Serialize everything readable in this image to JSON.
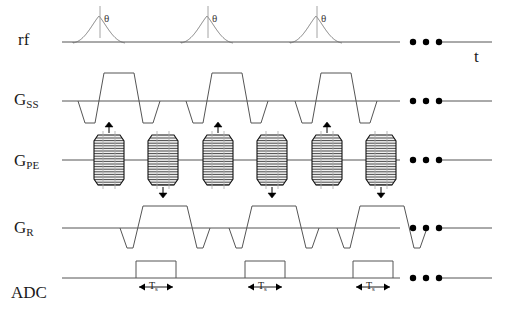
{
  "figure": {
    "type": "mri-pulse-sequence-diagram",
    "title": "",
    "background_color": "#ffffff",
    "line_color": "#555555",
    "text_color": "#1a1a1a",
    "blip_fill_color": "#f2f2f2",
    "blip_stroke_color": "#111111",
    "arrow_color": "#000000",
    "width": 514,
    "height": 315
  },
  "axis": {
    "time_label": "t",
    "time_label_x": 474,
    "time_label_y": 47
  },
  "rows": [
    {
      "name": "rf",
      "label": "rf",
      "label_sub": "",
      "label_x": 18,
      "label_y": 31,
      "baseline_y": 42,
      "line_start_x": 62,
      "line_end_x": 492,
      "events": [
        {
          "kind": "sinc-pulse",
          "x": 99,
          "annotation": "θ",
          "annotation_x": 104,
          "annotation_y": 12
        },
        {
          "kind": "sinc-pulse",
          "x": 207,
          "annotation": "θ",
          "annotation_x": 212,
          "annotation_y": 12
        },
        {
          "kind": "sinc-pulse",
          "x": 316,
          "annotation": "θ",
          "annotation_x": 321,
          "annotation_y": 12
        }
      ],
      "ellipsis": {
        "x": 413,
        "y": 42,
        "count": 3
      },
      "gap": {
        "from": 400,
        "to": 440
      }
    },
    {
      "name": "G_SS",
      "label": "G",
      "label_sub": "SS",
      "label_x": 14,
      "label_y": 91,
      "baseline_y": 101,
      "line_start_x": 62,
      "line_end_x": 492,
      "events": [
        {
          "kind": "ss-lobe",
          "x": 78
        },
        {
          "kind": "ss-lobe",
          "x": 186
        },
        {
          "kind": "ss-lobe",
          "x": 295
        }
      ],
      "ellipsis": {
        "x": 413,
        "y": 101,
        "count": 3
      },
      "gap": {
        "from": 400,
        "to": 440
      }
    },
    {
      "name": "G_PE",
      "label": "G",
      "label_sub": "PE",
      "label_x": 14,
      "label_y": 152,
      "baseline_y": 160,
      "line_start_x": 62,
      "line_end_x": 492,
      "blips": [
        {
          "x": 109,
          "direction": "up"
        },
        {
          "x": 163,
          "direction": "down"
        },
        {
          "x": 218,
          "direction": "up"
        },
        {
          "x": 272,
          "direction": "down"
        },
        {
          "x": 327,
          "direction": "up"
        },
        {
          "x": 381,
          "direction": "down"
        }
      ],
      "ellipsis": {
        "x": 413,
        "y": 160,
        "count": 3
      },
      "gap": {
        "from": 400,
        "to": 440
      }
    },
    {
      "name": "G_R",
      "label": "G",
      "label_sub": "R",
      "label_x": 14,
      "label_y": 219,
      "baseline_y": 228,
      "line_start_x": 62,
      "line_end_x": 492,
      "events": [
        {
          "kind": "readout-lobe",
          "x": 120
        },
        {
          "kind": "readout-lobe",
          "x": 229
        },
        {
          "kind": "readout-lobe",
          "x": 337
        }
      ],
      "ellipsis": {
        "x": 413,
        "y": 228,
        "count": 3
      },
      "gap": {
        "from": 400,
        "to": 440
      }
    },
    {
      "name": "ADC",
      "label": "ADC",
      "label_sub": "",
      "label_x": 11,
      "label_y": 284,
      "baseline_y": 278,
      "line_start_x": 62,
      "line_end_x": 492,
      "windows": [
        {
          "x": 136,
          "width": 40,
          "measure_label": "T",
          "measure_sub": "s"
        },
        {
          "x": 245,
          "width": 40,
          "measure_label": "T",
          "measure_sub": "s"
        },
        {
          "x": 353,
          "width": 40,
          "measure_label": "T",
          "measure_sub": "s"
        }
      ],
      "ellipsis": {
        "x": 413,
        "y": 278,
        "count": 3
      },
      "gap": {
        "from": 400,
        "to": 440
      }
    }
  ]
}
